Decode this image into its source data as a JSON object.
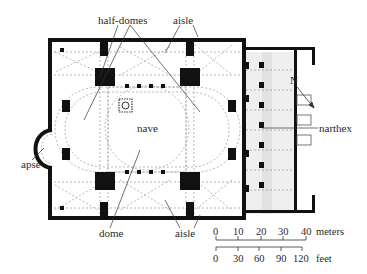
{
  "diagram": {
    "type": "architectural floor plan",
    "labels": {
      "half_domes": "half-domes",
      "aisle_top": "aisle",
      "nave": "nave",
      "narthex": "narthex",
      "apse": "apse",
      "dome": "dome",
      "aisle_bottom": "aisle",
      "north": "N"
    },
    "scale": {
      "meters": {
        "ticks": [
          "0",
          "10",
          "20",
          "30",
          "40"
        ],
        "unit": "meters"
      },
      "feet": {
        "ticks": [
          "0",
          "30",
          "60",
          "90",
          "120"
        ],
        "unit": "feet"
      }
    },
    "colors": {
      "wall": "#111111",
      "dashed_line": "#9a9a9a",
      "background": "#ffffff",
      "narthex_fill": "#ececec"
    }
  }
}
